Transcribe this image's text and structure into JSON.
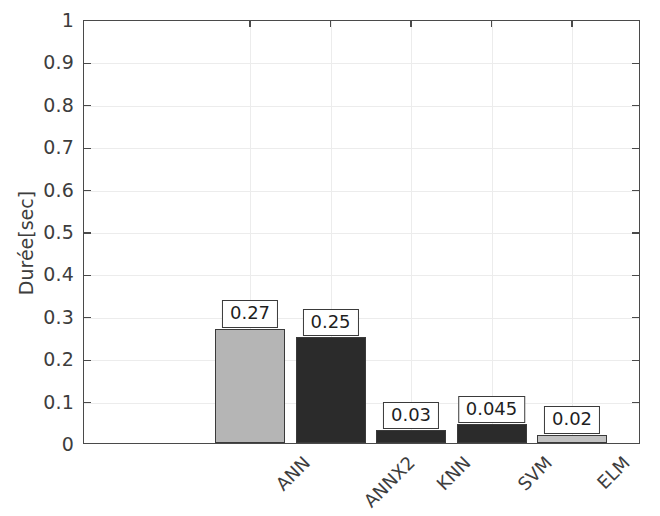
{
  "chart_data": {
    "type": "bar",
    "title": "",
    "xlabel": "",
    "ylabel": "Durée[sec]",
    "categories": [
      "ANN",
      "ANNX2",
      "KNN",
      "SVM",
      "ELM"
    ],
    "values": [
      0.27,
      0.25,
      0.03,
      0.045,
      0.02
    ],
    "value_labels": [
      "0.27",
      "0.25",
      "0.03",
      "0.045",
      "0.02"
    ],
    "bar_colors": [
      "#b5b5b5",
      "#2b2b2b",
      "#2b2b2b",
      "#2b2b2b",
      "#c2c2c2"
    ],
    "ylim": [
      0,
      1
    ],
    "yticks": [
      0,
      0.1,
      0.2,
      0.3,
      0.4,
      0.5,
      0.6,
      0.7,
      0.8,
      0.9,
      1
    ],
    "ytick_labels": [
      "0",
      "0.1",
      "0.2",
      "0.3",
      "0.4",
      "0.5",
      "0.6",
      "0.7",
      "0.8",
      "0.9",
      "1"
    ],
    "grid": true,
    "legend": "none",
    "xtick_rotation": -45,
    "axis_color": "#4a4a4a",
    "grid_color": "#ececec",
    "background": "#ffffff"
  }
}
